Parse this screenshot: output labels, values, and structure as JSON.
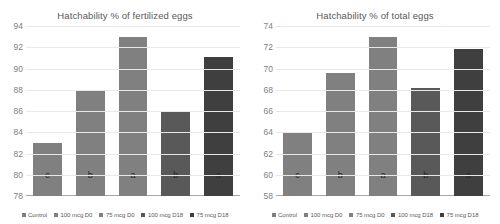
{
  "charts": [
    {
      "title": "Hatchability % of fertilized eggs",
      "legend": [
        {
          "label": "Control",
          "color": "#808080"
        },
        {
          "label": "100 mcg D0",
          "color": "#808080"
        },
        {
          "label": "75 mcg D0",
          "color": "#808080"
        },
        {
          "label": "100 mcg D18",
          "color": "#595959"
        },
        {
          "label": "75 mcg D18",
          "color": "#3f3f3f"
        }
      ],
      "chart_data": {
        "type": "bar",
        "title": "Hatchability % of fertilized eggs",
        "xlabel": "",
        "ylabel": "",
        "categories": [
          "Control",
          "100 mcg D0",
          "75 mcg D0",
          "100 mcg D18",
          "75 mcg D18"
        ],
        "values": [
          83.0,
          87.9,
          93.0,
          86.0,
          91.1
        ],
        "annotations": [
          "c",
          "b",
          "a",
          "b",
          "a"
        ],
        "colors": [
          "#808080",
          "#808080",
          "#808080",
          "#595959",
          "#3f3f3f"
        ],
        "ylim": [
          78,
          94
        ],
        "yticks": [
          78,
          80,
          82,
          84,
          86,
          88,
          90,
          92,
          94
        ],
        "grid": true,
        "legend_position": "bottom"
      }
    },
    {
      "title": "Hatchability % of total eggs",
      "legend": [
        {
          "label": "Control",
          "color": "#808080"
        },
        {
          "label": "100 mcg D0",
          "color": "#808080"
        },
        {
          "label": "75 mcg D0",
          "color": "#808080"
        },
        {
          "label": "100 mcg D18",
          "color": "#595959"
        },
        {
          "label": "75 mcg D18",
          "color": "#3f3f3f"
        }
      ],
      "chart_data": {
        "type": "bar",
        "title": "Hatchability % of total eggs",
        "xlabel": "",
        "ylabel": "",
        "categories": [
          "Control",
          "100 mcg D0",
          "75 mcg D0",
          "100 mcg D18",
          "75 mcg D18"
        ],
        "values": [
          64.0,
          69.6,
          73.0,
          68.2,
          71.8
        ],
        "annotations": [
          "c",
          "b",
          "a",
          "b",
          "a"
        ],
        "colors": [
          "#808080",
          "#808080",
          "#808080",
          "#595959",
          "#3f3f3f"
        ],
        "ylim": [
          58,
          74
        ],
        "yticks": [
          58,
          60,
          62,
          64,
          66,
          68,
          70,
          72,
          74
        ],
        "grid": true,
        "legend_position": "bottom"
      }
    }
  ]
}
